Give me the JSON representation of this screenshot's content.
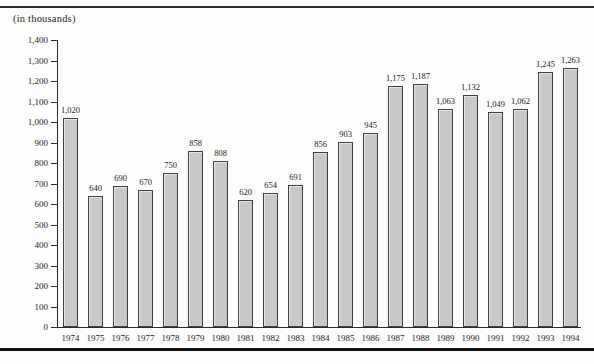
{
  "page": {
    "unit_label": "(in thousands)"
  },
  "chart_data": {
    "type": "bar",
    "title": "",
    "xlabel": "",
    "ylabel": "(in thousands)",
    "categories": [
      "1974",
      "1975",
      "1976",
      "1977",
      "1978",
      "1979",
      "1980",
      "1981",
      "1982",
      "1983",
      "1984",
      "1985",
      "1986",
      "1987",
      "1988",
      "1989",
      "1990",
      "1991",
      "1992",
      "1993",
      "1994"
    ],
    "values": [
      1020,
      640,
      690,
      670,
      750,
      858,
      808,
      620,
      654,
      691,
      856,
      903,
      945,
      1175,
      1187,
      1063,
      1132,
      1049,
      1062,
      1245,
      1263
    ],
    "value_labels": [
      "1,020",
      "640",
      "690",
      "670",
      "750",
      "858",
      "808",
      "620",
      "654",
      "691",
      "856",
      "903",
      "945",
      "1,175",
      "1,187",
      "1,063",
      "1,132",
      "1,049",
      "1,062",
      "1,245",
      "1,263"
    ],
    "ylim": [
      0,
      1400
    ],
    "ytick_step": 100,
    "ytick_labels": [
      "0",
      "100",
      "200",
      "300",
      "400",
      "500",
      "600",
      "700",
      "800",
      "900",
      "1,000",
      "1,100",
      "1,200",
      "1,300",
      "1,400"
    ],
    "grid": false,
    "legend": null,
    "bar_fill_color": "#c8c8c8",
    "bar_border_color": "#3f3f3f",
    "axis_color": "#2b2b2b",
    "text_color": "#1c1c1c"
  }
}
